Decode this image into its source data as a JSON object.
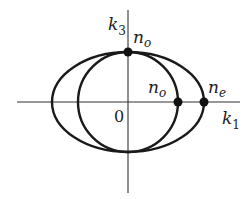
{
  "diagram": {
    "type": "index-surface",
    "axes": {
      "horizontal": {
        "label": "k",
        "subscript": "1"
      },
      "vertical": {
        "label": "k",
        "subscript": "3"
      },
      "origin_label": "0"
    },
    "curves": [
      {
        "name": "circle",
        "shape": "circle",
        "radius_label": "n_o"
      },
      {
        "name": "ellipse",
        "shape": "ellipse",
        "semi_axes_labels": [
          "n_e",
          "n_o"
        ]
      }
    ],
    "points": [
      {
        "label": "n",
        "subscript": "o",
        "position": "top intersection on k3 axis"
      },
      {
        "label": "n",
        "subscript": "o",
        "position": "circle crossing k1 axis"
      },
      {
        "label": "n",
        "subscript": "e",
        "position": "ellipse crossing k1 axis"
      }
    ],
    "colors": {
      "stroke": "#1a1a1a",
      "axis": "#333333",
      "background": "#ffffff"
    }
  }
}
